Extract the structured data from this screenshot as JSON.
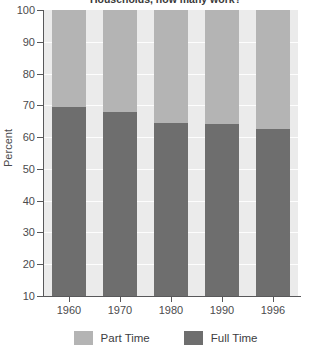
{
  "chart_data": {
    "type": "bar",
    "subtype": "stacked-100-percent",
    "title": "Households, how many work?",
    "xlabel": "",
    "ylabel": "Percent",
    "ylim": [
      10,
      100
    ],
    "yticks": [
      10,
      20,
      30,
      40,
      50,
      60,
      70,
      80,
      90,
      100
    ],
    "ytick_labels": [
      "10",
      "20",
      "30",
      "40",
      "50",
      "60",
      "70",
      "80",
      "90",
      "100"
    ],
    "grid": true,
    "legend_position": "bottom",
    "categories": [
      "1960",
      "1970",
      "1980",
      "1990",
      "1996"
    ],
    "series": [
      {
        "name": "Full Time",
        "color": "#6e6e6e",
        "values": [
          69.5,
          68.0,
          64.5,
          64.0,
          62.5
        ]
      },
      {
        "name": "Part Time",
        "color": "#b4b4b4",
        "values": [
          30.5,
          32.0,
          35.5,
          36.0,
          37.5
        ]
      }
    ]
  },
  "axis": {
    "y_title": "Percent"
  },
  "legend": {
    "items": [
      {
        "label": "Part Time",
        "swatch": "light-gray-swatch"
      },
      {
        "label": "Full Time",
        "swatch": "dark-gray-swatch"
      }
    ]
  },
  "colors": {
    "part_time": "#b4b4b4",
    "full_time": "#6e6e6e",
    "plot_background": "#ebebeb",
    "gridline": "#fdfdfd",
    "axis": "#58585a",
    "text": "#4b4b4d"
  }
}
